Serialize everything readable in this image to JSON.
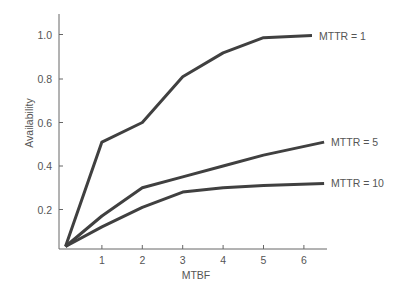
{
  "chart_data": {
    "type": "line",
    "title": "",
    "xlabel": "MTBF",
    "ylabel": "Availability",
    "xlim": [
      0,
      6.5
    ],
    "ylim": [
      0.02,
      1.1
    ],
    "x_ticks": [
      1,
      2,
      3,
      4,
      5,
      6
    ],
    "x_tick_labels": [
      "1",
      "2",
      "3",
      "4",
      "5",
      "6"
    ],
    "y_ticks": [
      0.2,
      0.4,
      0.6,
      0.8,
      1.0
    ],
    "y_tick_labels": [
      "0.2",
      "0.4",
      "0.6",
      "0.8",
      "1.0"
    ],
    "grid": false,
    "legend_position": "inline-right",
    "series": [
      {
        "name": "MTTR = 1",
        "x": [
          0.1,
          1,
          2,
          3,
          4,
          5,
          6.2
        ],
        "values": [
          0.03,
          0.51,
          0.6,
          0.81,
          0.92,
          0.99,
          1.0
        ]
      },
      {
        "name": "MTTR = 5",
        "x": [
          0.1,
          1,
          2,
          3,
          4,
          5,
          6.5
        ],
        "values": [
          0.03,
          0.17,
          0.3,
          0.35,
          0.4,
          0.45,
          0.51
        ]
      },
      {
        "name": "MTTR = 10",
        "x": [
          0.1,
          1,
          2,
          3,
          4,
          5,
          6.5
        ],
        "values": [
          0.03,
          0.12,
          0.21,
          0.28,
          0.3,
          0.31,
          0.32
        ]
      }
    ]
  },
  "style": {
    "line_color": "#404040",
    "axis_color": "#666666",
    "text_color": "#555555"
  }
}
